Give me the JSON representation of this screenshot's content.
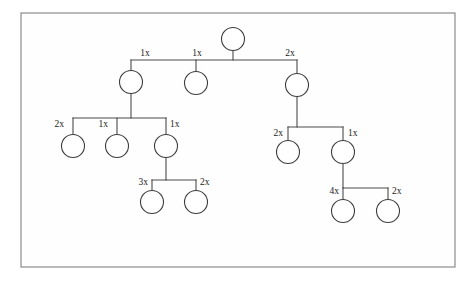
{
  "figure": {
    "background_color": "#ffffff",
    "frame": {
      "x": 21,
      "y": 13,
      "width": 434,
      "height": 254,
      "stroke_color": "#8c8c8c",
      "fill_color": "#fefefe"
    },
    "node_color": "#ffffff",
    "node_stroke_color": "#3c3c3c",
    "edge_color": "#4a4a4a",
    "label_color": "#1a1a1a",
    "node_radius": 11.5
  },
  "chart_data": {
    "type": "diagram",
    "diagram_kind": "tree",
    "title": "",
    "node_count": 15,
    "edge_label_suffix": "x",
    "nodes": [
      {
        "id": "root",
        "cx": 233,
        "cy": 39,
        "depth": 0,
        "parent": null,
        "label": ""
      },
      {
        "id": "a",
        "cx": 131,
        "cy": 82,
        "depth": 1,
        "parent": "root",
        "label": ""
      },
      {
        "id": "b",
        "cx": 196,
        "cy": 83,
        "depth": 1,
        "parent": "root",
        "label": ""
      },
      {
        "id": "c",
        "cx": 297,
        "cy": 85,
        "depth": 1,
        "parent": "root",
        "label": ""
      },
      {
        "id": "a1",
        "cx": 73,
        "cy": 146,
        "depth": 2,
        "parent": "a",
        "label": ""
      },
      {
        "id": "a2",
        "cx": 117,
        "cy": 146,
        "depth": 2,
        "parent": "a",
        "label": ""
      },
      {
        "id": "a3",
        "cx": 166,
        "cy": 146,
        "depth": 2,
        "parent": "a",
        "label": ""
      },
      {
        "id": "c1",
        "cx": 288,
        "cy": 152,
        "depth": 2,
        "parent": "c",
        "label": ""
      },
      {
        "id": "c2",
        "cx": 343,
        "cy": 152,
        "depth": 2,
        "parent": "c",
        "label": ""
      },
      {
        "id": "a3a",
        "cx": 152,
        "cy": 202,
        "depth": 3,
        "parent": "a3",
        "label": ""
      },
      {
        "id": "a3b",
        "cx": 196,
        "cy": 202,
        "depth": 3,
        "parent": "a3",
        "label": ""
      },
      {
        "id": "c2a",
        "cx": 343,
        "cy": 211,
        "depth": 3,
        "parent": "c2",
        "label": ""
      },
      {
        "id": "c2b",
        "cx": 388,
        "cy": 211,
        "depth": 3,
        "parent": "c2",
        "label": ""
      }
    ],
    "edges": [
      {
        "from": "root",
        "to": "a",
        "label": "1x",
        "label_x": 145,
        "label_y": 56,
        "anchor": "middle"
      },
      {
        "from": "root",
        "to": "b",
        "label": "1x",
        "label_x": 197,
        "label_y": 56,
        "anchor": "middle"
      },
      {
        "from": "root",
        "to": "c",
        "label": "2x",
        "label_x": 290,
        "label_y": 56,
        "anchor": "middle"
      },
      {
        "from": "a",
        "to": "a1",
        "label": "2x",
        "label_x": 64,
        "label_y": 127,
        "anchor": "end"
      },
      {
        "from": "a",
        "to": "a2",
        "label": "1x",
        "label_x": 108,
        "label_y": 127,
        "anchor": "end"
      },
      {
        "from": "a",
        "to": "a3",
        "label": "1x",
        "label_x": 170,
        "label_y": 127,
        "anchor": "start"
      },
      {
        "from": "c",
        "to": "c1",
        "label": "2x",
        "label_x": 283,
        "label_y": 136,
        "anchor": "end"
      },
      {
        "from": "c",
        "to": "c2",
        "label": "1x",
        "label_x": 348,
        "label_y": 136,
        "anchor": "start"
      },
      {
        "from": "a3",
        "to": "a3a",
        "label": "3x",
        "label_x": 148,
        "label_y": 185,
        "anchor": "end"
      },
      {
        "from": "a3",
        "to": "a3b",
        "label": "2x",
        "label_x": 200,
        "label_y": 185,
        "anchor": "start"
      },
      {
        "from": "c2",
        "to": "c2a",
        "label": "4x",
        "label_x": 339,
        "label_y": 194,
        "anchor": "end"
      },
      {
        "from": "c2",
        "to": "c2b",
        "label": "2x",
        "label_x": 392,
        "label_y": 194,
        "anchor": "start"
      }
    ],
    "sibling_groups": [
      {
        "parent": "root",
        "bar_y": 60,
        "bar_x1": 131,
        "bar_x2": 297,
        "stem_x": 233,
        "children": [
          "a",
          "b",
          "c"
        ]
      },
      {
        "parent": "a",
        "bar_y": 118,
        "bar_x1": 73,
        "bar_x2": 166,
        "stem_x": 131,
        "children": [
          "a1",
          "a2",
          "a3"
        ]
      },
      {
        "parent": "c",
        "bar_y": 127,
        "bar_x1": 288,
        "bar_x2": 343,
        "stem_x": 297,
        "children": [
          "c1",
          "c2"
        ]
      },
      {
        "parent": "a3",
        "bar_y": 180,
        "bar_x1": 152,
        "bar_x2": 196,
        "stem_x": 166,
        "children": [
          "a3a",
          "a3b"
        ]
      },
      {
        "parent": "c2",
        "bar_y": 188,
        "bar_x1": 343,
        "bar_x2": 388,
        "stem_x": 343,
        "children": [
          "c2a",
          "c2b"
        ]
      }
    ]
  }
}
